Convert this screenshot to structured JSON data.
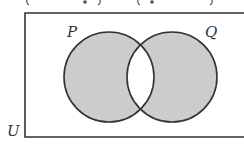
{
  "diagram": {
    "type": "venn",
    "caption_partial": "( · ) − ( · )",
    "universal_label": "U",
    "sets": [
      {
        "label": "P",
        "shaded": true
      },
      {
        "label": "Q",
        "shaded": true
      }
    ],
    "intersection_shaded": false,
    "shaded_region": "symmetric difference of P and Q",
    "colors": {
      "shade": "#cccccc",
      "stroke": "#333333",
      "background": "#ffffff"
    }
  }
}
